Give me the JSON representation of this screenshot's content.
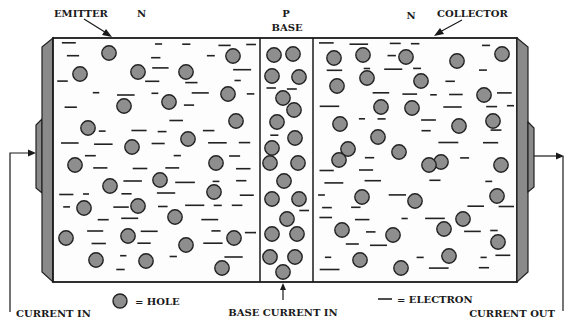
{
  "diagram": {
    "regions": [
      {
        "id": "emitter",
        "type_label": "N",
        "name_label": "EMITTER"
      },
      {
        "id": "base",
        "type_label": "P",
        "name_label": "BASE"
      },
      {
        "id": "collector",
        "type_label": "N",
        "name_label": "COLLECTOR"
      }
    ],
    "labels": {
      "emitter": "EMITTER",
      "collector": "COLLECTOR",
      "emitter_type": "N",
      "base_type": "P",
      "base": "BASE",
      "collector_type": "N",
      "current_in": "CURRENT IN",
      "base_current_in": "BASE CURRENT IN",
      "current_out": "CURRENT OUT"
    },
    "legend": {
      "hole_label": "= HOLE",
      "electron_label": "= ELECTRON"
    },
    "colors": {
      "hole_fill": "#8e8e8e",
      "plate_fill": "#8a8a8a",
      "ink": "#1a1a1a"
    },
    "carriers": {
      "emitter_holes": [
        [
          109,
          53
        ],
        [
          233,
          56
        ],
        [
          80,
          74
        ],
        [
          138,
          72
        ],
        [
          186,
          72
        ],
        [
          228,
          94
        ],
        [
          124,
          106
        ],
        [
          169,
          102
        ],
        [
          236,
          121
        ],
        [
          88,
          128
        ],
        [
          132,
          147
        ],
        [
          188,
          139
        ],
        [
          216,
          163
        ],
        [
          75,
          165
        ],
        [
          110,
          186
        ],
        [
          160,
          180
        ],
        [
          214,
          192
        ],
        [
          84,
          208
        ],
        [
          138,
          206
        ],
        [
          175,
          217
        ],
        [
          66,
          238
        ],
        [
          128,
          236
        ],
        [
          186,
          245
        ],
        [
          234,
          238
        ],
        [
          96,
          260
        ],
        [
          146,
          261
        ],
        [
          222,
          268
        ]
      ],
      "base_holes": [
        [
          274,
          55
        ],
        [
          293,
          54
        ],
        [
          272,
          76
        ],
        [
          299,
          77
        ],
        [
          283,
          98
        ],
        [
          294,
          110
        ],
        [
          277,
          122
        ],
        [
          295,
          138
        ],
        [
          272,
          148
        ],
        [
          298,
          163
        ],
        [
          270,
          163
        ],
        [
          284,
          181
        ],
        [
          272,
          199
        ],
        [
          299,
          199
        ],
        [
          287,
          219
        ],
        [
          272,
          234
        ],
        [
          297,
          234
        ],
        [
          270,
          257
        ],
        [
          295,
          257
        ],
        [
          283,
          272
        ]
      ],
      "collector_holes": [
        [
          334,
          58
        ],
        [
          363,
          55
        ],
        [
          406,
          57
        ],
        [
          457,
          61
        ],
        [
          502,
          54
        ],
        [
          337,
          86
        ],
        [
          367,
          78
        ],
        [
          421,
          81
        ],
        [
          381,
          107
        ],
        [
          340,
          124
        ],
        [
          484,
          95
        ],
        [
          412,
          108
        ],
        [
          493,
          121
        ],
        [
          378,
          137
        ],
        [
          459,
          126
        ],
        [
          348,
          149
        ],
        [
          399,
          152
        ],
        [
          441,
          162
        ],
        [
          339,
          160
        ],
        [
          429,
          165
        ],
        [
          501,
          165
        ],
        [
          362,
          197
        ],
        [
          415,
          201
        ],
        [
          497,
          196
        ],
        [
          463,
          219
        ],
        [
          342,
          230
        ],
        [
          393,
          235
        ],
        [
          444,
          229
        ],
        [
          498,
          242
        ],
        [
          360,
          260
        ],
        [
          449,
          256
        ],
        [
          401,
          268
        ]
      ],
      "electron_note": "Short horizontal dashes scattered throughout emitter and collector (N regions), fewer in base (P region)."
    }
  }
}
